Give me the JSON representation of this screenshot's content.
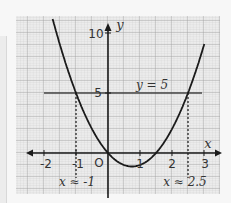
{
  "chart_data": {
    "type": "line",
    "title": "",
    "function": "y = 2x^2 - 3x",
    "xlabel": "x",
    "ylabel": "y",
    "xlim": [
      -2.9,
      3.5
    ],
    "ylim": [
      -3.4,
      11.4
    ],
    "grid": true,
    "x_ticks": [
      {
        "value": -2,
        "label": "-2"
      },
      {
        "value": -1,
        "label": "-1"
      },
      {
        "value": 1,
        "label": "1"
      },
      {
        "value": 2,
        "label": "2"
      },
      {
        "value": 3,
        "label": "3"
      }
    ],
    "y_ticks": [
      {
        "value": 5,
        "label": "5"
      },
      {
        "value": 10,
        "label": "10"
      }
    ],
    "origin_label": "O",
    "series": [
      {
        "name": "parabola",
        "x": [
          -1.75,
          -1.5,
          -1,
          -0.5,
          0,
          0.5,
          0.75,
          1,
          1.5,
          2,
          2.5,
          3
        ],
        "y": [
          11.4,
          9.0,
          5.0,
          2.0,
          0,
          -1.0,
          -1.125,
          -1.0,
          0,
          2.0,
          5.0,
          9.0
        ]
      }
    ],
    "annotations": [
      {
        "type": "hline",
        "y": 5,
        "label": "y = 5"
      },
      {
        "type": "vline_dashed",
        "x": -1,
        "label": "x ≈ -1"
      },
      {
        "type": "vline_dashed",
        "x": 2.5,
        "label": "x ≈ 2.5"
      }
    ]
  },
  "labels": {
    "x_axis": "x",
    "y_axis": "y",
    "origin": "O",
    "hline": "y = 5",
    "left_solution": "x ≈ -1",
    "right_solution": "x ≈ 2.5",
    "tick_m2": "-2",
    "tick_m1": "-1",
    "tick_1": "1",
    "tick_2": "2",
    "tick_3": "3",
    "tick_5": "5",
    "tick_10": "10"
  },
  "colors": {
    "curve": "#1a1a1a",
    "grid_major": "#9a9a9a",
    "grid_minor": "#cfcfcf",
    "axis": "#1a1a1a",
    "background": "#ececec"
  }
}
